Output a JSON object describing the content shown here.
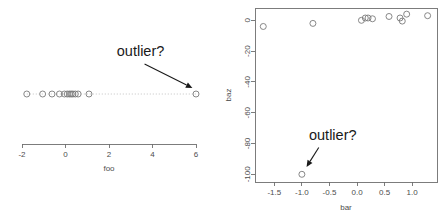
{
  "figure": {
    "title": "",
    "panel_count": 2
  },
  "chart_data": [
    {
      "type": "scatter",
      "panel": "left",
      "plot_style": "stripchart",
      "title": "",
      "xlabel": "foo",
      "ylabel": "",
      "xlim": [
        -2,
        6
      ],
      "xticks": [
        -2,
        0,
        2,
        4,
        6
      ],
      "xticklabels": [
        "-2",
        "0",
        "2",
        "4",
        "6"
      ],
      "yticks": [],
      "yticklabels": [],
      "grid": false,
      "legend": null,
      "x": [
        -1.78,
        -1.05,
        -0.62,
        -0.28,
        -0.05,
        0.08,
        0.18,
        0.26,
        0.34,
        0.45,
        0.58,
        1.08,
        6.0
      ],
      "y": [
        0,
        0,
        0,
        0,
        0,
        0,
        0,
        0,
        0,
        0,
        0,
        0,
        0
      ],
      "connector_line": true,
      "annotations": [
        {
          "text": "outlier?",
          "text_x": 3.45,
          "text_y": 0.62,
          "arrow_to_x": 5.88,
          "arrow_to_y": 0.07
        }
      ]
    },
    {
      "type": "scatter",
      "panel": "right",
      "plot_style": "scatter",
      "title": "",
      "xlabel": "bar",
      "ylabel": "baz",
      "xlim": [
        -1.85,
        1.45
      ],
      "ylim": [
        -105,
        8
      ],
      "xticks": [
        -1.5,
        -1.0,
        -0.5,
        0.0,
        0.5,
        1.0
      ],
      "xticklabels": [
        "-1.5",
        "-1.0",
        "-0.5",
        "0.0",
        "0.5",
        "1.0"
      ],
      "yticks": [
        0,
        -20,
        -40,
        -60,
        -80,
        -100
      ],
      "yticklabels": [
        "0",
        "-20",
        "-40",
        "-60",
        "-80",
        "-100"
      ],
      "grid": false,
      "legend": null,
      "x": [
        -1.7,
        -1.0,
        -0.8,
        0.08,
        0.15,
        0.2,
        0.28,
        0.58,
        0.78,
        0.82,
        0.9,
        1.28
      ],
      "y": [
        -4.0,
        -100.0,
        -2.0,
        0.0,
        1.5,
        1.5,
        1.0,
        2.5,
        1.5,
        -0.5,
        4.0,
        3.0
      ],
      "annotations": [
        {
          "text": "outlier?",
          "text_x": -0.44,
          "text_y": -78.0,
          "arrow_to_x": -0.97,
          "arrow_to_y": -96.5
        }
      ]
    }
  ],
  "colors": {
    "background": "#ffffff",
    "axis": "#6e6e6e",
    "point_stroke": "#7a7a7a",
    "connector": "#aaaaaa",
    "tick_text": "#4d4d4d",
    "annotation_text": "#1a1a1a"
  }
}
